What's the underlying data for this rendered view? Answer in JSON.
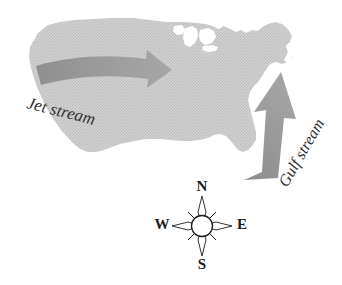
{
  "figure": {
    "background_color": "#ffffff",
    "width": 342,
    "height": 285
  },
  "map": {
    "name": "united-states-silhouette",
    "fill_color": "#c9c9c9",
    "texture": "halftone-dither",
    "edge_color": "#bdbdbd"
  },
  "arrows": {
    "jet_stream": {
      "label": "Jet stream",
      "direction": "east",
      "fill_color": "#9c9c9c",
      "label_rotation_deg": 14,
      "label_color": "#2f2f2f",
      "label_font_size_px": 17
    },
    "gulf_stream": {
      "label": "Gulf stream",
      "direction": "north-northeast",
      "fill_color": "#9a9a9a",
      "label_rotation_deg": -60,
      "label_color": "#4a4a4a",
      "label_font_size_px": 16
    }
  },
  "compass": {
    "name": "compass-rose",
    "star_fill": "#ffffff",
    "star_stroke": "#1c1c1c",
    "hub_fill": "#ffffff",
    "letter_color": "#1c1c1c",
    "letter_font_size_px": 15,
    "points": [
      {
        "key": "north",
        "label": "N"
      },
      {
        "key": "east",
        "label": "E"
      },
      {
        "key": "south",
        "label": "S"
      },
      {
        "key": "west",
        "label": "W"
      }
    ]
  }
}
